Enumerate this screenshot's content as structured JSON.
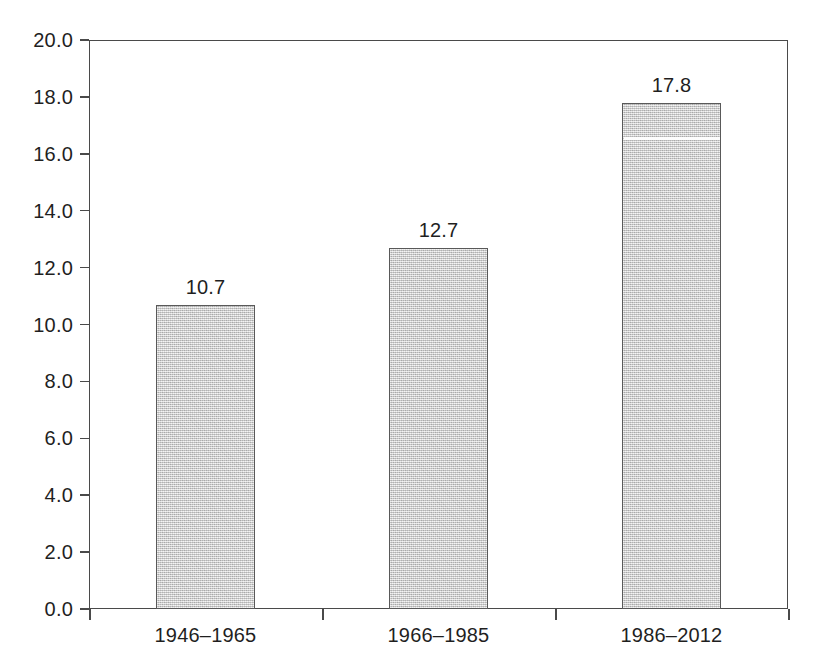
{
  "chart_data": {
    "type": "bar",
    "title": "",
    "subtitle": "",
    "xlabel": "",
    "ylabel": "",
    "categories": [
      "1946–1965",
      "1966–1985",
      "1986–2012"
    ],
    "values": [
      10.7,
      12.7,
      17.8
    ],
    "value_labels": [
      "10.7",
      "12.7",
      "17.8"
    ],
    "ylim": [
      0.0,
      20.0
    ],
    "ytick_step": 2.0,
    "ytick_labels": [
      "0.0",
      "2.0",
      "4.0",
      "6.0",
      "8.0",
      "10.0",
      "12.0",
      "14.0",
      "16.0",
      "18.0",
      "20.0"
    ],
    "ytick_values": [
      0.0,
      2.0,
      4.0,
      6.0,
      8.0,
      10.0,
      12.0,
      14.0,
      16.0,
      18.0,
      20.0
    ],
    "grid": false,
    "legend": null,
    "legend_position": "none",
    "bar_fill_color": "#cccccc",
    "bar_border_color": "#595959",
    "axis_color": "#4a4a4a",
    "background_color": "#ffffff",
    "text_color": "#1f1f1f",
    "annotations": [
      {
        "name": "scan-artifact-line",
        "description": "thin white horizontal streak across third bar",
        "series_index": 2,
        "at_value": 16.6
      }
    ]
  }
}
